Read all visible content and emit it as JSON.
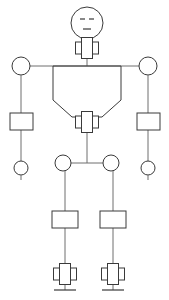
{
  "diagram": {
    "background_color": "#ffffff",
    "stroke_color": "#3a3a3a",
    "link_color": "#6e6e6e",
    "fill_color": "#ffffff",
    "canvas": {
      "width": 169,
      "height": 300
    },
    "parts": {
      "head": {
        "label": "head",
        "cx": 87,
        "cy": 23,
        "r": 16
      },
      "face": {
        "left_eye": {
          "label": "left-eye",
          "x1": 80,
          "y1": 19,
          "x2": 85,
          "y2": 19
        },
        "right_eye": {
          "label": "right-eye",
          "x1": 89,
          "y1": 19,
          "x2": 94,
          "y2": 19
        },
        "mouth": {
          "label": "mouth",
          "x1": 83,
          "y1": 29,
          "x2": 91,
          "y2": 29
        }
      },
      "neck_joint": {
        "label": "neck-joint",
        "cx": 87,
        "cy": 48
      },
      "shoulder_left": {
        "label": "left-shoulder-joint",
        "cx": 21,
        "cy": 66,
        "r": 9
      },
      "shoulder_right": {
        "label": "right-shoulder-joint",
        "cx": 148,
        "cy": 66,
        "r": 9
      },
      "shoulder_bar": {
        "label": "shoulder-bar",
        "x1": 30,
        "y1": 66,
        "x2": 139,
        "y2": 66
      },
      "torso": {
        "label": "torso",
        "points": "53,66 53,100 72,117 102,117 121,100 121,66"
      },
      "hip_joint": {
        "label": "hip-joint",
        "cx": 87,
        "cy": 122
      },
      "upper_arm_left": {
        "label": "left-upper-arm-link",
        "x": 10,
        "y": 113,
        "w": 23,
        "h": 17
      },
      "upper_arm_right": {
        "label": "right-upper-arm-link",
        "x": 137,
        "y": 113,
        "w": 23,
        "h": 17
      },
      "hand_left": {
        "label": "left-hand-joint",
        "cx": 21,
        "cy": 168,
        "r": 7
      },
      "hand_right": {
        "label": "right-hand-joint",
        "cx": 148,
        "cy": 168,
        "r": 7
      },
      "hip_left": {
        "label": "left-hip-joint",
        "cx": 63,
        "cy": 163,
        "r": 8
      },
      "hip_right": {
        "label": "right-hip-joint",
        "cx": 111,
        "cy": 163,
        "r": 8
      },
      "pelvis_bar": {
        "label": "pelvis-bar",
        "x1": 71,
        "y1": 163,
        "x2": 103,
        "y2": 163
      },
      "thigh_left": {
        "label": "left-thigh-link",
        "x": 52,
        "y": 211,
        "w": 26,
        "h": 17
      },
      "thigh_right": {
        "label": "right-thigh-link",
        "x": 100,
        "y": 211,
        "w": 26,
        "h": 17
      },
      "ankle_left": {
        "label": "left-ankle-joint",
        "cx": 65,
        "cy": 274
      },
      "ankle_right": {
        "label": "right-ankle-joint",
        "cx": 113,
        "cy": 274
      },
      "ground_left": {
        "label": "left-ground-line",
        "x1": 54,
        "y1": 290,
        "x2": 76,
        "y2": 290
      },
      "ground_right": {
        "label": "right-ground-line",
        "x1": 102,
        "y1": 290,
        "x2": 124,
        "y2": 290
      }
    },
    "joint_symbol": {
      "label": "revolute-joint-symbol",
      "center_width": 11,
      "center_height": 21,
      "side_width": 6,
      "side_height": 12
    }
  }
}
